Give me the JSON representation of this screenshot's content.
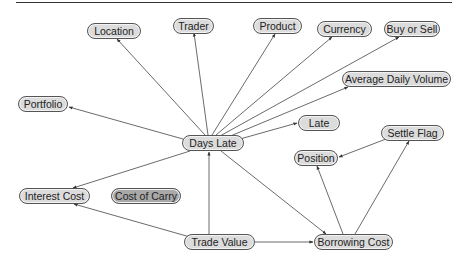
{
  "diagram": {
    "colors": {
      "node_fill": "#dcdcdc",
      "node_fill_highlight": "#a9a9a9",
      "edge": "#444444",
      "border": "#555555"
    },
    "nodes": [
      {
        "id": "location",
        "label": "Location",
        "x": 87,
        "y": 23,
        "w": 54
      },
      {
        "id": "trader",
        "label": "Trader",
        "x": 173,
        "y": 18,
        "w": 41
      },
      {
        "id": "product",
        "label": "Product",
        "x": 253,
        "y": 18,
        "w": 49
      },
      {
        "id": "currency",
        "label": "Currency",
        "x": 317,
        "y": 21,
        "w": 55
      },
      {
        "id": "buy_or_sell",
        "label": "Buy or Sell",
        "x": 384,
        "y": 21,
        "w": 56
      },
      {
        "id": "average_daily_volume",
        "label": "Average Daily Volume",
        "x": 342,
        "y": 71,
        "w": 109
      },
      {
        "id": "portfolio",
        "label": "Portfolio",
        "x": 18,
        "y": 96,
        "w": 50
      },
      {
        "id": "days_late",
        "label": "Days Late",
        "x": 182,
        "y": 135,
        "w": 62
      },
      {
        "id": "late",
        "label": "Late",
        "x": 298,
        "y": 115,
        "w": 42
      },
      {
        "id": "settle_flag",
        "label": "Settle Flag",
        "x": 381,
        "y": 125,
        "w": 63
      },
      {
        "id": "position",
        "label": "Position",
        "x": 294,
        "y": 150,
        "w": 44
      },
      {
        "id": "interest_cost",
        "label": "Interest Cost",
        "x": 19,
        "y": 188,
        "w": 71
      },
      {
        "id": "cost_of_carry",
        "label": "Cost of Carry",
        "x": 111,
        "y": 188,
        "w": 70,
        "highlight": true
      },
      {
        "id": "trade_value",
        "label": "Trade Value",
        "x": 184,
        "y": 234,
        "w": 71
      },
      {
        "id": "borrowing_cost",
        "label": "Borrowing Cost",
        "x": 314,
        "y": 234,
        "w": 79
      }
    ],
    "edges": [
      {
        "from": "days_late",
        "to": "location",
        "x1": 205,
        "y1": 135,
        "x2": 117,
        "y2": 39
      },
      {
        "from": "days_late",
        "to": "trader",
        "x1": 208,
        "y1": 135,
        "x2": 194,
        "y2": 33
      },
      {
        "from": "days_late",
        "to": "product",
        "x1": 212,
        "y1": 135,
        "x2": 275,
        "y2": 34
      },
      {
        "from": "days_late",
        "to": "currency",
        "x1": 216,
        "y1": 135,
        "x2": 332,
        "y2": 37
      },
      {
        "from": "days_late",
        "to": "buy_or_sell",
        "x1": 220,
        "y1": 136,
        "x2": 399,
        "y2": 37
      },
      {
        "from": "days_late",
        "to": "average_daily_volume",
        "x1": 228,
        "y1": 137,
        "x2": 348,
        "y2": 87
      },
      {
        "from": "days_late",
        "to": "late",
        "x1": 240,
        "y1": 139,
        "x2": 297,
        "y2": 123
      },
      {
        "from": "days_late",
        "to": "portfolio",
        "x1": 183,
        "y1": 139,
        "x2": 69,
        "y2": 107
      },
      {
        "from": "days_late",
        "to": "interest_cost",
        "x1": 190,
        "y1": 151,
        "x2": 73,
        "y2": 188
      },
      {
        "from": "days_late",
        "to": "borrowing_cost",
        "x1": 221,
        "y1": 151,
        "x2": 326,
        "y2": 234
      },
      {
        "from": "trade_value",
        "to": "days_late",
        "x1": 209,
        "y1": 234,
        "x2": 209,
        "y2": 152
      },
      {
        "from": "trade_value",
        "to": "interest_cost",
        "x1": 190,
        "y1": 237,
        "x2": 74,
        "y2": 204
      },
      {
        "from": "trade_value",
        "to": "borrowing_cost",
        "x1": 255,
        "y1": 242,
        "x2": 313,
        "y2": 242
      },
      {
        "from": "borrowing_cost",
        "to": "position",
        "x1": 343,
        "y1": 234,
        "x2": 317,
        "y2": 166
      },
      {
        "from": "borrowing_cost",
        "to": "settle_flag",
        "x1": 355,
        "y1": 234,
        "x2": 409,
        "y2": 141
      },
      {
        "from": "settle_flag",
        "to": "position",
        "x1": 386,
        "y1": 139,
        "x2": 339,
        "y2": 157
      }
    ]
  }
}
